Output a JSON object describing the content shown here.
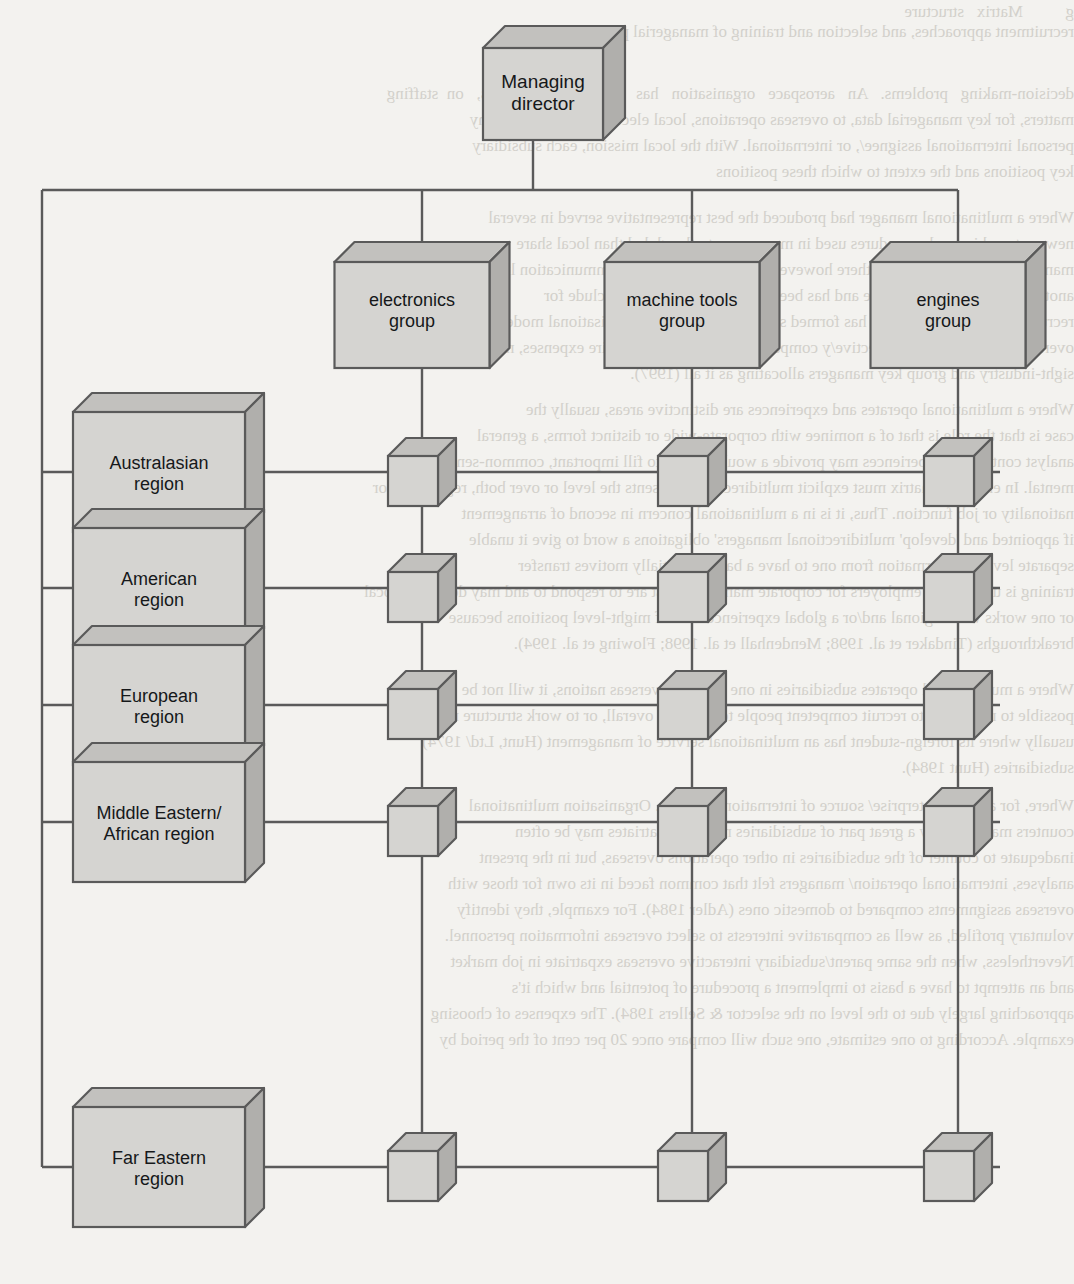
{
  "diagram": {
    "type": "matrix-organisation-chart",
    "colors": {
      "background": "#f3f2ef",
      "box_front": "#d5d4d1",
      "box_top": "#c2c1be",
      "box_side": "#b0afac",
      "outline": "#5a5a5a",
      "connector": "#5a5a5a",
      "text": "#16181a",
      "bleed_text": "#b9b6ae"
    }
  },
  "top": {
    "managing_director": "Managing director"
  },
  "groups": [
    {
      "id": "electronics",
      "label": "electronics\ngroup",
      "line1": "electronics",
      "line2": "group"
    },
    {
      "id": "machine-tools",
      "label": "machine tools\ngroup",
      "line1": "machine tools",
      "line2": "group"
    },
    {
      "id": "engines",
      "label": "engines\ngroup",
      "line1": "engines",
      "line2": "group"
    }
  ],
  "regions": [
    {
      "id": "australasian",
      "line1": "Australasian",
      "line2": "region"
    },
    {
      "id": "american",
      "line1": "American",
      "line2": "region"
    },
    {
      "id": "european",
      "line1": "European",
      "line2": "region"
    },
    {
      "id": "middle-eastern",
      "line1": "Middle Eastern/",
      "line2": "African region"
    },
    {
      "id": "far-eastern",
      "line1": "Far Eastern",
      "line2": "region"
    }
  ],
  "matrix": {
    "rows": 5,
    "cols": 3,
    "node_label": "",
    "description": "Small cube at every region × group intersection"
  },
  "bleed_lines": [
    {
      "x": 50,
      "y": 2,
      "size": 17,
      "text": "g          Matrix   structure"
    },
    {
      "x": 48,
      "y": 22,
      "size": 17,
      "text": "recruitment approaches, and selection and training of managerial personnel."
    },
    {
      "x": 36,
      "y": 84,
      "size": 17,
      "text": "decision-making   problems.   An   aerospace   organisation   has   four   policy   groups,   on  staffing"
    },
    {
      "x": 36,
      "y": 110,
      "size": 17,
      "text": "matters, for key managerial data, to overseas operations, local electronic patent company"
    },
    {
      "x": 36,
      "y": 136,
      "size": 17,
      "text": "personal international assignee/, or international. With the local mission, each subsidiary"
    },
    {
      "x": 36,
      "y": 162,
      "size": 17,
      "text": "key positions and the extent to which these positions"
    },
    {
      "x": 36,
      "y": 208,
      "size": 17,
      "text": "Where a multinational manager had produced the best representative served in several"
    },
    {
      "x": 36,
      "y": 234,
      "size": 17,
      "text": "new partnerships and procedures used in many more to the global than local share"
    },
    {
      "x": 36,
      "y": 260,
      "size": 17,
      "text": "manufacturers at lower level; there however is more to pragmatic communication lines in"
    },
    {
      "x": 36,
      "y": 286,
      "size": 17,
      "text": "another, as is known to operate and has been from expatriates may include for"
    },
    {
      "x": 36,
      "y": 312,
      "size": 17,
      "text": "recruiting and evaluation, and has formed structure roles on an organisational model"
    },
    {
      "x": 36,
      "y": 338,
      "size": 17,
      "text": "overseas and telecom sort effective/y companies have moved to require expenses, might"
    },
    {
      "x": 36,
      "y": 364,
      "size": 17,
      "text": "sight-industry and group key managers allocating as it all (1997)."
    },
    {
      "x": 36,
      "y": 400,
      "size": 17,
      "text": "Where a multinational operates and experiences are distinctive areas, usually the"
    },
    {
      "x": 36,
      "y": 426,
      "size": 17,
      "text": "case is that the role is that of a nominee with corporate-wide or distinct forms, a general"
    },
    {
      "x": 36,
      "y": 452,
      "size": 17,
      "text": "analyst continuous experiences may provide a would sought to fill important, common-sense"
    },
    {
      "x": 36,
      "y": 478,
      "size": 17,
      "text": "mental. In entered a matrix must explicit multidirectional presents the level or over both, regulations or"
    },
    {
      "x": 36,
      "y": 504,
      "size": 17,
      "text": "nationality or job function. Thus, it is in a multinational concern in second of arrangement"
    },
    {
      "x": 36,
      "y": 530,
      "size": 17,
      "text": "if appointed and 'develop' multidirectional managers' obligations a word to give it unable"
    },
    {
      "x": 36,
      "y": 556,
      "size": 17,
      "text": "separate level of information from one to have a basis of initially motives transfer"
    },
    {
      "x": 36,
      "y": 582,
      "size": 17,
      "text": "training is understood employers for corporate managers must are to respond to and may develop a local"
    },
    {
      "x": 36,
      "y": 608,
      "size": 17,
      "text": "or one works with regional and/or a global experience to staff might-level positions because"
    },
    {
      "x": 36,
      "y": 634,
      "size": 17,
      "text": "breakthroughs (Tindaker et al. 1998; Mendenhall et al. 1998; Flowing et al. 1994)."
    },
    {
      "x": 36,
      "y": 680,
      "size": 17,
      "text": "Where a multinational operates subsidiaries in one or more overseas nations, it will not be"
    },
    {
      "x": 36,
      "y": 706,
      "size": 17,
      "text": "possible to near work to recruit competent people to the level overall, or to work structure model,"
    },
    {
      "x": 36,
      "y": 732,
      "size": 17,
      "text": "usually where its foreign-student has an multinational service of management (Hunt, Ltd/ 1974)"
    },
    {
      "x": 36,
      "y": 758,
      "size": 17,
      "text": "subsidiaries (Hunt 1984)."
    },
    {
      "x": 36,
      "y": 796,
      "size": 17,
      "text": "Where, for also, an enterprise/ source of international system. Organisation multinational"
    },
    {
      "x": 36,
      "y": 822,
      "size": 17,
      "text": "counters made up only a great part of subsidiaries needs. Expatriates may be often"
    },
    {
      "x": 36,
      "y": 848,
      "size": 17,
      "text": "inadequate to counter of the subsidiaries in other operations overseas, but in the present"
    },
    {
      "x": 36,
      "y": 874,
      "size": 17,
      "text": "analyses, international operation/ managers felt that common faced in its own for those with"
    },
    {
      "x": 36,
      "y": 900,
      "size": 17,
      "text": "overseas assignments compared to domestic ones (Adler 1984). For example, they identify"
    },
    {
      "x": 36,
      "y": 926,
      "size": 17,
      "text": "voluntary profiled, as well as comparative interests to select overseas information personnel."
    },
    {
      "x": 36,
      "y": 952,
      "size": 17,
      "text": "Nevertheless, when the same parent/subsidiary interactive overseas expatriate in job market"
    },
    {
      "x": 36,
      "y": 978,
      "size": 17,
      "text": "and an attempt to have a basis to implement a procedure of potential and which it's"
    },
    {
      "x": 36,
      "y": 1004,
      "size": 17,
      "text": "approaching largely due to the level on the selector & Sellers 1984). The expenses of choosing"
    },
    {
      "x": 36,
      "y": 1030,
      "size": 17,
      "text": "example. According to one estimate, one such will compare once 20 per cent of the period by"
    }
  ]
}
